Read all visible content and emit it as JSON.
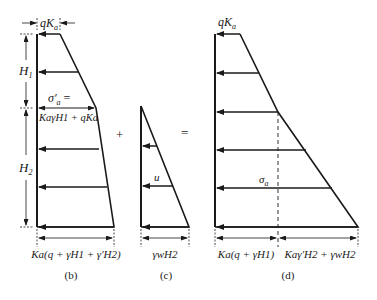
{
  "panel_b": {
    "caption": "(b)",
    "top_label": "qK",
    "top_label_sub": "a",
    "h1_label": "H",
    "h1_sub": "1",
    "h2_label": "H",
    "h2_sub": "2",
    "sigma_label": "σ′",
    "sigma_sub": "a",
    "sigma_eq": "=",
    "sigma_expr": "KaγH1 + qKa",
    "bottom_expr": "Ka(q + γH1 + γ′H2)"
  },
  "panel_c": {
    "caption": "(c)",
    "u_label": "u",
    "bottom_expr": "γwH2"
  },
  "panel_d": {
    "caption": "(d)",
    "top_label": "qKa",
    "sigma_label": "σa",
    "bottom_left_expr": "Ka(q + γH1)",
    "bottom_right_expr": "Kaγ′H2 + γwH2"
  },
  "operators": {
    "plus": "+",
    "equals": "="
  },
  "colors": {
    "line": "#1a1a1a",
    "background": "#ffffff"
  }
}
